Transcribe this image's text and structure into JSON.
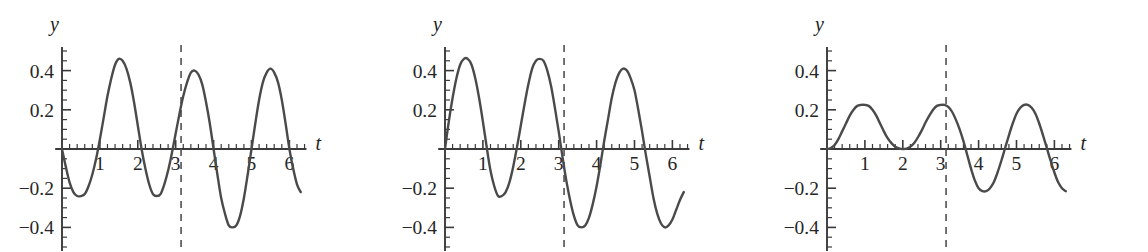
{
  "figure": {
    "panel_count": 3,
    "background_color": "#ffffff",
    "curve_color": "#4a4a4a",
    "axis_color": "#3a3a3a",
    "dashed_line_color": "#5a5a5a"
  },
  "chart_data": [
    {
      "type": "line",
      "title": "",
      "xlabel": "t",
      "ylabel": "y",
      "xlim": [
        -0.18,
        6.45
      ],
      "ylim": [
        -0.52,
        0.52
      ],
      "xticks": [
        1,
        2,
        3,
        4,
        5,
        6
      ],
      "xtick_labels": [
        "1",
        "2",
        "3",
        "4",
        "5",
        "6"
      ],
      "yticks": [
        0.4,
        0.2,
        -0.2,
        -0.4
      ],
      "ytick_labels": [
        "0.4",
        "0.2",
        "−0.2",
        "−0.4"
      ],
      "minor_tick_step": 0.2,
      "grid": false,
      "legend": null,
      "annotations": [
        {
          "type": "vline",
          "x": 3.1416,
          "style": "dashed",
          "label": "t = π"
        }
      ],
      "series": [
        {
          "name": "y1",
          "x": [
            0.0,
            0.1,
            0.2,
            0.3,
            0.4,
            0.5,
            0.6,
            0.7,
            0.8,
            0.9,
            1.0,
            1.1,
            1.2,
            1.3,
            1.4,
            1.5,
            1.6,
            1.7,
            1.8,
            1.9,
            2.0,
            2.1,
            2.2,
            2.3,
            2.4,
            2.5,
            2.6,
            2.7,
            2.8,
            2.9,
            3.0,
            3.1,
            3.2,
            3.3,
            3.4,
            3.5,
            3.6,
            3.7,
            3.8,
            3.9,
            4.0,
            4.1,
            4.2,
            4.3,
            4.4,
            4.5,
            4.6,
            4.7,
            4.8,
            4.9,
            5.0,
            5.1,
            5.2,
            5.3,
            5.4,
            5.5,
            5.6,
            5.7,
            5.8,
            5.9,
            6.0,
            6.1,
            6.2,
            6.3
          ],
          "y": [
            0.0,
            -0.09,
            -0.17,
            -0.22,
            -0.24,
            -0.24,
            -0.23,
            -0.19,
            -0.13,
            -0.05,
            0.05,
            0.16,
            0.27,
            0.36,
            0.43,
            0.46,
            0.45,
            0.41,
            0.34,
            0.24,
            0.12,
            0.0,
            -0.1,
            -0.18,
            -0.23,
            -0.24,
            -0.23,
            -0.18,
            -0.11,
            -0.02,
            0.08,
            0.18,
            0.27,
            0.34,
            0.39,
            0.4,
            0.38,
            0.33,
            0.24,
            0.13,
            0.0,
            -0.13,
            -0.25,
            -0.33,
            -0.39,
            -0.4,
            -0.39,
            -0.34,
            -0.25,
            -0.13,
            0.0,
            0.13,
            0.25,
            0.34,
            0.39,
            0.41,
            0.39,
            0.34,
            0.25,
            0.13,
            0.0,
            -0.1,
            -0.18,
            -0.22
          ]
        }
      ]
    },
    {
      "type": "line",
      "title": "",
      "xlabel": "t",
      "ylabel": "y",
      "xlim": [
        -0.18,
        6.45
      ],
      "ylim": [
        -0.52,
        0.52
      ],
      "xticks": [
        1,
        2,
        3,
        4,
        5,
        6
      ],
      "xtick_labels": [
        "1",
        "2",
        "3",
        "4",
        "5",
        "6"
      ],
      "yticks": [
        0.4,
        0.2,
        -0.2,
        -0.4
      ],
      "ytick_labels": [
        "0.4",
        "0.2",
        "−0.2",
        "−0.4"
      ],
      "minor_tick_step": 0.2,
      "grid": false,
      "legend": null,
      "annotations": [
        {
          "type": "vline",
          "x": 3.1416,
          "style": "dashed",
          "label": "t = π"
        }
      ],
      "series": [
        {
          "name": "y2",
          "x": [
            0.0,
            0.1,
            0.2,
            0.3,
            0.4,
            0.5,
            0.6,
            0.7,
            0.8,
            0.9,
            1.0,
            1.1,
            1.2,
            1.3,
            1.4,
            1.5,
            1.6,
            1.7,
            1.8,
            1.9,
            2.0,
            2.1,
            2.2,
            2.3,
            2.4,
            2.5,
            2.6,
            2.7,
            2.8,
            2.9,
            3.0,
            3.1,
            3.2,
            3.3,
            3.4,
            3.5,
            3.6,
            3.7,
            3.8,
            3.9,
            4.0,
            4.1,
            4.2,
            4.3,
            4.4,
            4.5,
            4.6,
            4.7,
            4.8,
            4.9,
            5.0,
            5.1,
            5.2,
            5.3,
            5.4,
            5.5,
            5.6,
            5.7,
            5.8,
            5.9,
            6.0,
            6.1,
            6.2,
            6.3
          ],
          "y": [
            0.0,
            0.14,
            0.26,
            0.36,
            0.43,
            0.46,
            0.46,
            0.43,
            0.36,
            0.26,
            0.14,
            0.01,
            -0.11,
            -0.19,
            -0.24,
            -0.24,
            -0.22,
            -0.17,
            -0.09,
            0.01,
            0.12,
            0.23,
            0.33,
            0.41,
            0.45,
            0.46,
            0.45,
            0.4,
            0.32,
            0.21,
            0.09,
            -0.04,
            -0.16,
            -0.26,
            -0.34,
            -0.39,
            -0.4,
            -0.39,
            -0.35,
            -0.28,
            -0.19,
            -0.08,
            0.04,
            0.15,
            0.26,
            0.34,
            0.39,
            0.41,
            0.4,
            0.36,
            0.3,
            0.2,
            0.09,
            -0.03,
            -0.14,
            -0.25,
            -0.33,
            -0.38,
            -0.4,
            -0.39,
            -0.36,
            -0.31,
            -0.26,
            -0.22
          ]
        }
      ]
    },
    {
      "type": "line",
      "title": "",
      "xlabel": "t",
      "ylabel": "y",
      "xlim": [
        -0.18,
        6.45
      ],
      "ylim": [
        -0.52,
        0.52
      ],
      "xticks": [
        1,
        2,
        3,
        4,
        5,
        6
      ],
      "xtick_labels": [
        "1",
        "2",
        "3",
        "4",
        "5",
        "6"
      ],
      "yticks": [
        0.4,
        0.2,
        -0.2,
        -0.4
      ],
      "ytick_labels": [
        "0.4",
        "0.2",
        "−0.2",
        "−0.4"
      ],
      "minor_tick_step": 0.2,
      "grid": false,
      "legend": null,
      "annotations": [
        {
          "type": "vline",
          "x": 3.1416,
          "style": "dashed",
          "label": "t = π"
        }
      ],
      "series": [
        {
          "name": "y3",
          "x": [
            0.0,
            0.1,
            0.2,
            0.3,
            0.4,
            0.5,
            0.6,
            0.7,
            0.8,
            0.9,
            1.0,
            1.1,
            1.2,
            1.3,
            1.4,
            1.5,
            1.6,
            1.7,
            1.8,
            1.9,
            2.0,
            2.1,
            2.2,
            2.3,
            2.4,
            2.5,
            2.6,
            2.7,
            2.8,
            2.9,
            3.0,
            3.1,
            3.2,
            3.3,
            3.4,
            3.5,
            3.6,
            3.7,
            3.8,
            3.9,
            4.0,
            4.1,
            4.2,
            4.3,
            4.4,
            4.5,
            4.6,
            4.7,
            4.8,
            4.9,
            5.0,
            5.1,
            5.2,
            5.3,
            5.4,
            5.5,
            5.6,
            5.7,
            5.8,
            5.9,
            6.0,
            6.1,
            6.2,
            6.3
          ],
          "y": [
            0.0,
            0.005,
            0.02,
            0.05,
            0.09,
            0.13,
            0.17,
            0.2,
            0.22,
            0.225,
            0.225,
            0.22,
            0.2,
            0.17,
            0.13,
            0.09,
            0.055,
            0.03,
            0.012,
            0.003,
            0.0,
            0.002,
            0.012,
            0.03,
            0.06,
            0.095,
            0.135,
            0.17,
            0.2,
            0.22,
            0.225,
            0.225,
            0.215,
            0.19,
            0.15,
            0.1,
            0.04,
            -0.03,
            -0.1,
            -0.16,
            -0.2,
            -0.215,
            -0.215,
            -0.2,
            -0.17,
            -0.12,
            -0.06,
            0.005,
            0.07,
            0.13,
            0.18,
            0.21,
            0.225,
            0.225,
            0.21,
            0.18,
            0.13,
            0.07,
            0.005,
            -0.06,
            -0.12,
            -0.17,
            -0.2,
            -0.215
          ]
        }
      ]
    }
  ]
}
